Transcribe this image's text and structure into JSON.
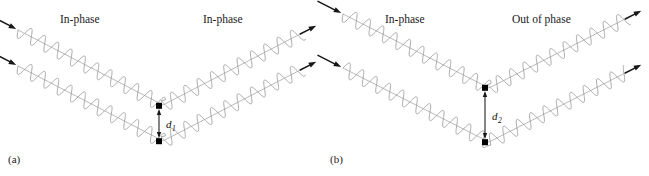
{
  "figure": {
    "type": "bragg-diffraction-diagram",
    "width": 649,
    "height": 176,
    "background_color": "#ffffff"
  },
  "panels": [
    {
      "id": "a",
      "label": "(a)",
      "label_pos": {
        "x": 8,
        "y": 163
      },
      "origin_x": 0,
      "vertex_x": 163,
      "incoming_label": "In-phase",
      "incoming_label_pos": {
        "x": 60,
        "y": 23
      },
      "outgoing_label": "In-phase",
      "outgoing_label_pos": {
        "x": 203,
        "y": 23
      },
      "spacing_label": "d",
      "spacing_subscript": "1",
      "spacing_label_pos": {
        "x": 166,
        "y": 128
      },
      "dimension_line": {
        "x": 159,
        "y_top": 106,
        "y_bottom": 141
      },
      "upper_beam": {
        "start_y": 30,
        "vertex_y": 105
      },
      "lower_beam": {
        "start_y": 66,
        "vertex_y": 141
      },
      "wave_amplitude": 7.5,
      "wave_period": 15,
      "upper_phase_offset": 0,
      "lower_phase_offset": 0
    },
    {
      "id": "b",
      "label": "(b)",
      "label_pos": {
        "x": 330,
        "y": 163
      },
      "origin_x": 325,
      "vertex_x": 489,
      "incoming_label": "In-phase",
      "incoming_label_pos": {
        "x": 385,
        "y": 23
      },
      "outgoing_label": "Out of phase",
      "outgoing_label_pos": {
        "x": 512,
        "y": 23
      },
      "spacing_label": "d",
      "spacing_subscript": "2",
      "spacing_label_pos": {
        "x": 492,
        "y": 120
      },
      "dimension_line": {
        "x": 485,
        "y_top": 88,
        "y_bottom": 142
      },
      "upper_beam": {
        "start_y": 14,
        "vertex_y": 88
      },
      "lower_beam": {
        "start_y": 68,
        "vertex_y": 142
      },
      "wave_amplitude": 7.5,
      "wave_period": 15,
      "upper_phase_offset": 0,
      "lower_phase_offset": 0.5
    }
  ],
  "colors": {
    "wave_stroke": "#9a9a9a",
    "axis_stroke": "#a8a8a8",
    "ray_arrow": "#171717",
    "dimension_line": "#222222",
    "text": "#1a1a1a",
    "marker": "#000000"
  }
}
